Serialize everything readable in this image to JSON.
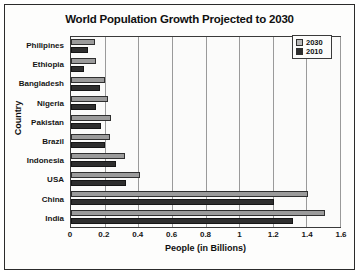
{
  "chart_data": {
    "type": "bar",
    "orientation": "horizontal",
    "title": "World Population Growth Projected to 2030",
    "xlabel": "People (in Billions)",
    "ylabel": "Country",
    "xlim": [
      0,
      1.6
    ],
    "xticks": [
      "0",
      "0.2",
      "0.4",
      "0.6",
      "0.8",
      "1",
      "1.2",
      "1.4",
      "1.6"
    ],
    "xtick_values": [
      0,
      0.2,
      0.4,
      0.6,
      0.8,
      1,
      1.2,
      1.4,
      1.6
    ],
    "grid": true,
    "grid_axis": "x",
    "legend_position": "top-right",
    "categories": [
      "Philipines",
      "Ethiopia",
      "Bangladesh",
      "Nigeria",
      "Pakistan",
      "Brazil",
      "Indonesia",
      "USA",
      "China",
      "India"
    ],
    "series": [
      {
        "name": "2030",
        "color": "#9b9b9b",
        "values": [
          0.14,
          0.15,
          0.2,
          0.22,
          0.24,
          0.23,
          0.32,
          0.41,
          1.41,
          1.51
        ]
      },
      {
        "name": "2010",
        "color": "#2e2e2e",
        "values": [
          0.1,
          0.08,
          0.17,
          0.15,
          0.18,
          0.2,
          0.27,
          0.33,
          1.21,
          1.32
        ]
      }
    ]
  },
  "legend": {
    "items": [
      {
        "label": "2030",
        "swatch": "light-gray"
      },
      {
        "label": "2010",
        "swatch": "black"
      }
    ]
  }
}
